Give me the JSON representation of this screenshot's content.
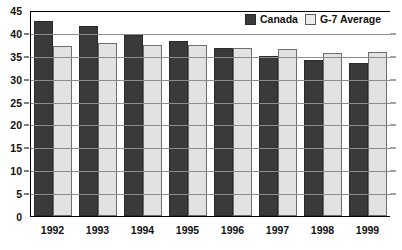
{
  "chart_data": {
    "type": "bar",
    "title": "",
    "xlabel": "",
    "ylabel": "",
    "categories": [
      "1992",
      "1993",
      "1994",
      "1995",
      "1996",
      "1997",
      "1998",
      "1999"
    ],
    "series": [
      {
        "name": "Canada",
        "color": "#3a3a3a",
        "values": [
          42.6,
          41.6,
          39.5,
          38.2,
          36.6,
          35.0,
          34.1,
          33.5
        ]
      },
      {
        "name": "G-7 Average",
        "color": "#e2e2e2",
        "values": [
          37.2,
          37.9,
          37.4,
          37.3,
          36.7,
          36.5,
          35.7,
          35.8
        ]
      }
    ],
    "ylim": [
      0,
      45
    ],
    "yticks": [
      0,
      5,
      10,
      15,
      20,
      25,
      30,
      35,
      40,
      45
    ],
    "grid": true,
    "legend_position": "top-right"
  },
  "legend": {
    "items": [
      {
        "label": "Canada",
        "swatch": "canada"
      },
      {
        "label": "G-7 Average",
        "swatch": "g7"
      }
    ]
  },
  "colors": {
    "canada": "#3a3a3a",
    "g7": "#e2e2e2",
    "gridline": "#8c8c8c",
    "axis": "#000000",
    "background": "#ffffff"
  }
}
